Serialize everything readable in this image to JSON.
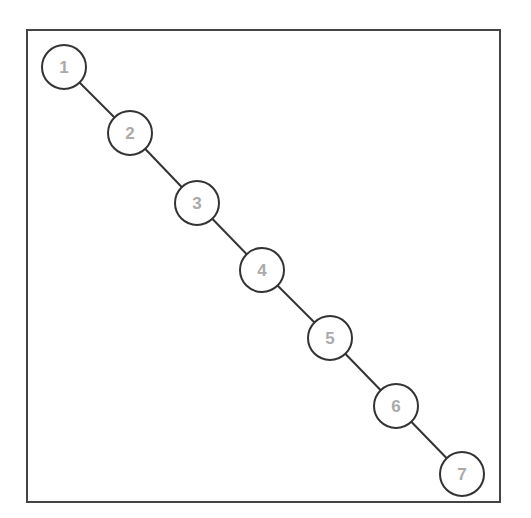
{
  "diagram": {
    "type": "binary-tree-degenerate",
    "colors": {
      "edge": "#333333",
      "node_stroke": "#333333",
      "node_fill": "#ffffff",
      "label": "#aaaaaa",
      "frame": "#444444"
    },
    "nodes": [
      {
        "id": "1",
        "label": "1",
        "cx": 64,
        "cy": 67
      },
      {
        "id": "2",
        "label": "2",
        "cx": 130,
        "cy": 133
      },
      {
        "id": "3",
        "label": "3",
        "cx": 197,
        "cy": 203
      },
      {
        "id": "4",
        "label": "4",
        "cx": 262,
        "cy": 270
      },
      {
        "id": "5",
        "label": "5",
        "cx": 330,
        "cy": 338
      },
      {
        "id": "6",
        "label": "6",
        "cx": 396,
        "cy": 406
      },
      {
        "id": "7",
        "label": "7",
        "cx": 462,
        "cy": 474
      }
    ],
    "edges": [
      {
        "from": "1",
        "to": "2"
      },
      {
        "from": "2",
        "to": "3"
      },
      {
        "from": "3",
        "to": "4"
      },
      {
        "from": "4",
        "to": "5"
      },
      {
        "from": "5",
        "to": "6"
      },
      {
        "from": "6",
        "to": "7"
      }
    ]
  }
}
